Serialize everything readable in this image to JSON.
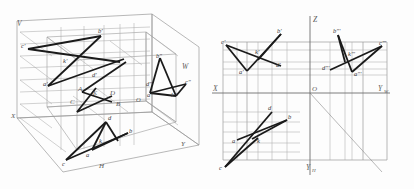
{
  "diagram": {
    "colors": {
      "thin_line": "#9a9a9a",
      "thick_line": "#1a1a1a",
      "axis_line": "#6e6e6e",
      "label_text": "#5a5a5a",
      "background": "#fdfdfd"
    }
  },
  "left_figure": {
    "name": "spatial-projection-box",
    "planes": [
      {
        "key": "V",
        "label": "V"
      },
      {
        "key": "W",
        "label": "W"
      },
      {
        "key": "H",
        "label": "H"
      }
    ],
    "axes": [
      {
        "key": "X",
        "label": "X"
      },
      {
        "key": "Y",
        "label": "Y"
      }
    ],
    "origin_label": "O",
    "space_points": [
      {
        "label": "A"
      },
      {
        "label": "B"
      },
      {
        "label": "C"
      },
      {
        "label": "D"
      },
      {
        "label": "K"
      }
    ],
    "v_projections": [
      {
        "label": "a'"
      },
      {
        "label": "b'"
      },
      {
        "label": "c'"
      },
      {
        "label": "d'"
      },
      {
        "label": "k'"
      }
    ],
    "w_projections": [
      {
        "label": "a\""
      },
      {
        "label": "b\""
      },
      {
        "label": "c\""
      },
      {
        "label": "d\""
      },
      {
        "label": "k\""
      }
    ],
    "h_projections": [
      {
        "label": "a"
      },
      {
        "label": "b"
      },
      {
        "label": "c"
      },
      {
        "label": "d"
      },
      {
        "label": "k"
      }
    ]
  },
  "right_figure": {
    "name": "orthographic-three-view",
    "axes": [
      {
        "key": "Z",
        "label": "Z"
      },
      {
        "key": "X",
        "label": "X"
      },
      {
        "key": "YW",
        "label": "Y",
        "sub": "W"
      },
      {
        "key": "YH",
        "label": "Y",
        "sub": "H"
      }
    ],
    "origin_label": "O",
    "front_view": [
      {
        "label": "a'"
      },
      {
        "label": "b'"
      },
      {
        "label": "c'"
      },
      {
        "label": "d'"
      },
      {
        "label": "k'"
      }
    ],
    "side_view": [
      {
        "label": "a\"'"
      },
      {
        "label": "b\"'"
      },
      {
        "label": "c\"'"
      },
      {
        "label": "d\"'"
      },
      {
        "label": "k\"'"
      }
    ],
    "top_view": [
      {
        "label": "a"
      },
      {
        "label": "b"
      },
      {
        "label": "c"
      },
      {
        "label": "d"
      },
      {
        "label": "k"
      }
    ]
  }
}
